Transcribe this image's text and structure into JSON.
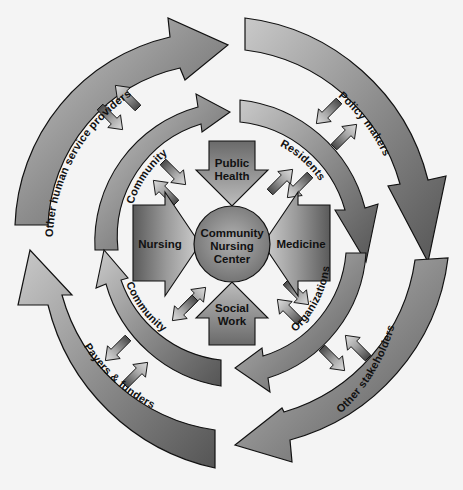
{
  "corner_text": "ure 15",
  "center": {
    "line1": "Community",
    "line2": "Nursing",
    "line3": "Center"
  },
  "disciplines": {
    "top": {
      "line1": "Public",
      "line2": "Health"
    },
    "left": {
      "label": "Nursing"
    },
    "right": {
      "label": "Medicine"
    },
    "bottom": {
      "line1": "Social",
      "line2": "Work"
    }
  },
  "inner_ring": [
    {
      "label": "Community",
      "position": "top-left"
    },
    {
      "label": "Residents",
      "position": "top-right"
    },
    {
      "label": "Organizations",
      "position": "bottom-right"
    },
    {
      "label": "Community",
      "position": "bottom-left"
    }
  ],
  "outer_ring": [
    {
      "label": "Other human service providers",
      "position": "top-left"
    },
    {
      "label": "Policy makers",
      "position": "top-right"
    },
    {
      "label": "Other stakeholders",
      "position": "bottom-right"
    },
    {
      "label": "Payers & funders",
      "position": "bottom-left"
    }
  ],
  "colors": {
    "arrow_dark": "#555555",
    "arrow_mid": "#8a8a8a",
    "arrow_light": "#c8c8c8",
    "outline": "#111111",
    "background": "#f4f4f4"
  }
}
